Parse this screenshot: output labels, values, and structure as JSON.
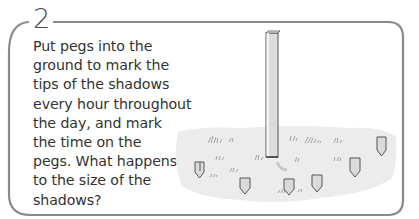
{
  "step": {
    "number": "2",
    "lines": [
      "Put pegs into the",
      "ground to mark the",
      "tips of the shadows",
      "every hour throughout",
      "the day, and mark",
      "the time on the",
      "pegs. What happens",
      "to the size of the",
      "shadows?"
    ]
  },
  "illustration": {
    "subject": "upright post with shadow-tip pegs in grassy ground",
    "peg_count": 7,
    "colors": {
      "frame": "#8a8a8a",
      "ground": "#ececec",
      "post": "#d9d9d9",
      "outline": "#555555",
      "shadow": "#c8c8c8"
    }
  }
}
